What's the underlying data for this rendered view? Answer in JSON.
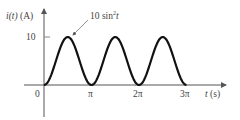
{
  "chart_data": {
    "type": "line",
    "title": "",
    "ylabel": "i(t) (A)",
    "xlabel": "t (s)",
    "series": [
      {
        "name": "10 sin²t",
        "function": "10*sin(t)^2",
        "x": [
          0,
          0.3927,
          0.7854,
          1.1781,
          1.5708,
          1.9635,
          2.3562,
          2.7489,
          3.1416,
          3.5343,
          3.927,
          4.3197,
          4.7124,
          5.1051,
          5.4978,
          5.8905,
          6.2832,
          6.6759,
          7.0686,
          7.4613,
          7.854,
          8.2467,
          8.6394,
          9.0321,
          9.4248
        ],
        "values": [
          0,
          1.46,
          5,
          8.54,
          10,
          8.54,
          5,
          1.46,
          0,
          1.46,
          5,
          8.54,
          10,
          8.54,
          5,
          1.46,
          0,
          1.46,
          5,
          8.54,
          10,
          8.54,
          5,
          1.46,
          0
        ]
      }
    ],
    "x_ticks": [
      "0",
      "π",
      "2π",
      "3π"
    ],
    "y_ticks": [
      "10"
    ],
    "xlim": [
      0,
      9.4248
    ],
    "ylim": [
      0,
      10
    ],
    "grid": false,
    "annotations": [
      "10 sin²t"
    ]
  },
  "labels": {
    "y_axis_fn": "i",
    "y_axis_arg": "(t)",
    "y_axis_unit": "(A)",
    "x_axis_var": "t",
    "x_axis_unit": "(s)",
    "tick_10": "10",
    "tick_0": "0",
    "tick_pi": "π",
    "tick_2pi": "2π",
    "tick_3pi": "3π",
    "curve_coef": "10 sin",
    "curve_exp": "2",
    "curve_var": "t"
  }
}
